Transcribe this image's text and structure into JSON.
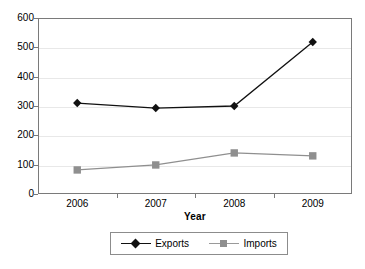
{
  "chart_data": {
    "type": "line",
    "title": "",
    "xlabel": "Year",
    "ylabel": "",
    "categories": [
      "2006",
      "2007",
      "2008",
      "2009"
    ],
    "series": [
      {
        "name": "Exports",
        "values": [
          310,
          293,
          300,
          518
        ],
        "color": "#111111",
        "marker": "diamond"
      },
      {
        "name": "Imports",
        "values": [
          82,
          99,
          140,
          130
        ],
        "color": "#8f8f8f",
        "marker": "square"
      }
    ],
    "ylim": [
      0,
      600
    ],
    "yticks": [
      0,
      100,
      200,
      300,
      400,
      500,
      600
    ],
    "ytick_labels": [
      "0",
      "100",
      "200",
      "300",
      "400",
      "500",
      "600"
    ],
    "grid": true,
    "legend_position": "bottom"
  },
  "legend": {
    "entries": [
      {
        "label": "Exports",
        "marker_name": "legend-marker-diamond"
      },
      {
        "label": "Imports",
        "marker_name": "legend-marker-square"
      }
    ]
  },
  "axes": {
    "x_title": "Year"
  },
  "colors": {
    "exports": "#111111",
    "imports": "#8f8f8f",
    "axis": "#7a7a7a",
    "grid": "#e8e8e8",
    "background": "#ffffff"
  }
}
